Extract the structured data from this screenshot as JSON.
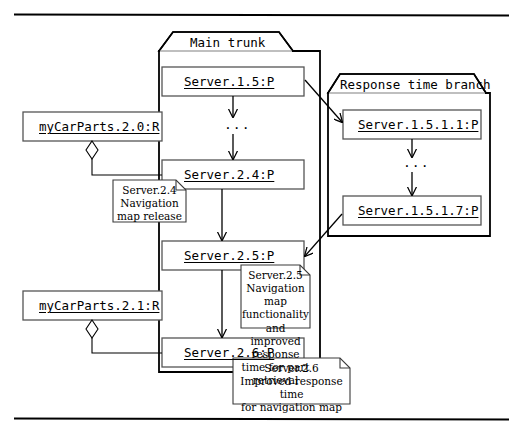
{
  "diagram": {
    "colors": {
      "stroke": "#000000",
      "node_stroke": "#4a4a4a",
      "background": "#ffffff",
      "note_stroke": "#3a3a3a"
    },
    "frame": {
      "top_rule": "horizontal-rule",
      "bottom_rule": "horizontal-rule"
    }
  },
  "packages": [
    {
      "id": "main-trunk",
      "label": "Main trunk"
    },
    {
      "id": "response-time-branch",
      "label": "Response time branch"
    }
  ],
  "nodes": [
    {
      "id": "server-1-5",
      "label": "Server.1.5:P"
    },
    {
      "id": "server-2-4",
      "label": "Server.2.4:P"
    },
    {
      "id": "server-2-5",
      "label": "Server.2.5:P"
    },
    {
      "id": "server-2-6",
      "label": "Server.2.6:P"
    },
    {
      "id": "server-1-5-1-1",
      "label": "Server.1.5.1.1:P"
    },
    {
      "id": "server-1-5-1-7",
      "label": "Server.1.5.1.7:P"
    },
    {
      "id": "mycarparts-2-0",
      "label": "myCarParts.2.0:R"
    },
    {
      "id": "mycarparts-2-1",
      "label": "myCarParts.2.1:R"
    }
  ],
  "ellipses": [
    {
      "id": "trunk-ellipsis",
      "label": "..."
    },
    {
      "id": "branch-ellipsis",
      "label": "..."
    }
  ],
  "notes": [
    {
      "id": "note-server-2-4",
      "title": "Server.2.4",
      "body": "Navigation map release",
      "text": "Server.2.4\nNavigation map release"
    },
    {
      "id": "note-server-2-5",
      "title": "Server.2.5",
      "body": "Navigation map functionality and improved response time for part retrieval",
      "text": "Server.2.5\nNavigation map functionality\nand improved response\ntime for part retrieval"
    },
    {
      "id": "note-server-2-6",
      "title": "Server.2.6",
      "body": "Improved response time for navigation map",
      "text": "Server.2.6\nImproved response time\nfor navigation map"
    }
  ]
}
